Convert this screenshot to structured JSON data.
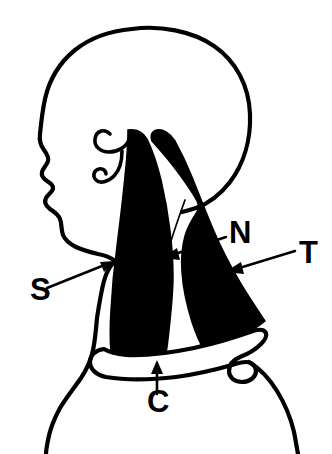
{
  "figure": {
    "style": "black and white line drawing with solid black filled muscles",
    "colors": {
      "ink": "#000000",
      "background": "#ffffff",
      "muscle_fill": "#000000"
    }
  },
  "labels": [
    {
      "id": "S",
      "text": "S",
      "meaning": "sternocleidomastoid muscle",
      "x": 30,
      "y": 300,
      "arrow": {
        "from_x": 47,
        "from_y": 288,
        "to_x": 112,
        "to_y": 262
      }
    },
    {
      "id": "N",
      "text": "N",
      "meaning": "spinal accessory nerve",
      "x": 229,
      "y": 243,
      "arrow": {
        "from_x": 226,
        "from_y": 237,
        "to_x": 163,
        "to_y": 258
      }
    },
    {
      "id": "T",
      "text": "T",
      "meaning": "trapezius muscle",
      "x": 299,
      "y": 263,
      "arrow": {
        "from_x": 295,
        "from_y": 251,
        "to_x": 226,
        "to_y": 272
      }
    },
    {
      "id": "C",
      "text": "C",
      "meaning": "clavicle",
      "x": 147,
      "y": 412,
      "arrow": {
        "from_x": 157,
        "from_y": 394,
        "to_x": 157,
        "to_y": 361
      }
    }
  ],
  "parts": {
    "skull_outline": "skull-outline",
    "face_profile": "face-profile",
    "ear": "ear-outline",
    "sternocleidomastoid": "sternocleidomastoid-muscle",
    "trapezius": "trapezius-muscle",
    "accessory_nerve": "accessory-nerve-line",
    "clavicle": "clavicle-outline",
    "neck_front": "neck-front-contour",
    "shoulder": "shoulder-contour"
  }
}
